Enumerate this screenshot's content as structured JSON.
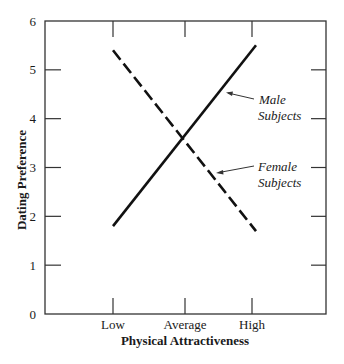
{
  "chart_data": {
    "type": "line",
    "title": "",
    "xlabel": "Physical Attractiveness",
    "ylabel": "Dating Preference",
    "categories": [
      "Low",
      "Average",
      "High"
    ],
    "series": [
      {
        "name": "Male Subjects",
        "values": [
          1.8,
          3.6,
          5.4
        ],
        "style": "solid",
        "color": "#111111"
      },
      {
        "name": "Female Subjects",
        "values": [
          5.4,
          3.6,
          1.8
        ],
        "style": "dashed",
        "color": "#111111"
      }
    ],
    "ylim": [
      0,
      6
    ],
    "yticks": [
      0,
      1,
      2,
      3,
      4,
      5,
      6
    ],
    "grid": false,
    "legend": "inline annotations with arrows on right side",
    "annotations": [
      {
        "label_line1": "Male",
        "label_line2": "Subjects",
        "series": "Male Subjects"
      },
      {
        "label_line1": "Female",
        "label_line2": "Subjects",
        "series": "Female Subjects"
      }
    ]
  }
}
